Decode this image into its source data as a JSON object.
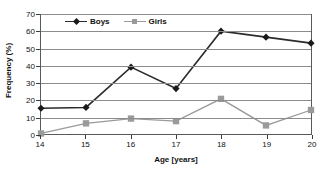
{
  "chart_data": {
    "type": "line",
    "title": "",
    "xlabel": "Age [years]",
    "ylabel": "Frequency (%)",
    "categories": [
      "14",
      "15",
      "16",
      "17",
      "18",
      "19",
      "20"
    ],
    "x": [
      14,
      15,
      16,
      17,
      18,
      19,
      20
    ],
    "ylim": [
      0,
      70
    ],
    "yticks": [
      0,
      10,
      20,
      30,
      40,
      50,
      60,
      70
    ],
    "ytick_labels": [
      "0",
      "10",
      "20",
      "30",
      "40",
      "50",
      "60",
      "70"
    ],
    "xlim": [
      14,
      20
    ],
    "grid": "horizontal",
    "legend_position": "top-left-inside",
    "series": [
      {
        "name": "Boys",
        "color": "#2b2b2b",
        "marker": "diamond",
        "marker_color": "#1a1a1a",
        "values": [
          15,
          15.5,
          39,
          26.5,
          60,
          56.5,
          53
        ]
      },
      {
        "name": "Girls",
        "color": "#9a9a9a",
        "marker": "square",
        "marker_color": "#9a9a9a",
        "values": [
          0.3,
          6.2,
          9,
          7.5,
          20.5,
          5,
          14
        ]
      }
    ]
  },
  "axes": {
    "frame_color": "#5a5a5a",
    "gridline_color": "#8c8c8c",
    "tick_color": "#3d3d3d"
  }
}
